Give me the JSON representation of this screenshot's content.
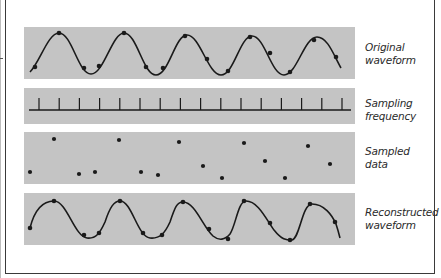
{
  "figure": {
    "rows": [
      {
        "id": "original",
        "label_line1": "Original",
        "label_line2": "waveform"
      },
      {
        "id": "sampling",
        "label_line1": "Sampling",
        "label_line2": "frequency"
      },
      {
        "id": "sampled",
        "label_line1": "Sampled",
        "label_line2": "data"
      },
      {
        "id": "reconstructed",
        "label_line1": "Reconstructed",
        "label_line2": "waveform"
      }
    ],
    "colors": {
      "band": "#c4c4c4",
      "ink": "#1a1a1a",
      "frame": "#3a3a3a",
      "background": "#ffffff"
    },
    "sampling_tick_count": 16,
    "original_points": [
      [
        35,
        67
      ],
      [
        59,
        33
      ],
      [
        84,
        68
      ],
      [
        99,
        66
      ],
      [
        124,
        33
      ],
      [
        146,
        67
      ],
      [
        163,
        68
      ],
      [
        185,
        36
      ],
      [
        207,
        59
      ],
      [
        228,
        71
      ],
      [
        250,
        37
      ],
      [
        270,
        53
      ],
      [
        290,
        72
      ],
      [
        314,
        40
      ],
      [
        336,
        57
      ]
    ],
    "sampled_points": [
      [
        30,
        172
      ],
      [
        54,
        139
      ],
      [
        79,
        174
      ],
      [
        95,
        172
      ],
      [
        119,
        140
      ],
      [
        141,
        172
      ],
      [
        158,
        175
      ],
      [
        179,
        142
      ],
      [
        203,
        166
      ],
      [
        222,
        178
      ],
      [
        244,
        143
      ],
      [
        265,
        161
      ],
      [
        285,
        178
      ],
      [
        308,
        146
      ],
      [
        330,
        164
      ]
    ],
    "reconstructed_points": [
      [
        30,
        228
      ],
      [
        54,
        201
      ],
      [
        84,
        235
      ],
      [
        99,
        233
      ],
      [
        120,
        201
      ],
      [
        143,
        233
      ],
      [
        162,
        235
      ],
      [
        183,
        202
      ],
      [
        209,
        229
      ],
      [
        228,
        239
      ],
      [
        244,
        201
      ],
      [
        270,
        223
      ],
      [
        290,
        240
      ],
      [
        310,
        204
      ],
      [
        335,
        222
      ]
    ]
  }
}
